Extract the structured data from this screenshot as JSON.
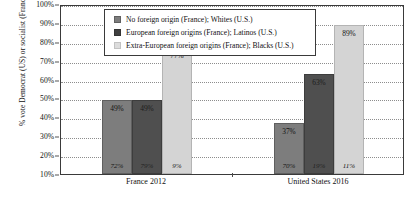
{
  "chart_data": {
    "type": "bar",
    "title": "",
    "xlabel": "",
    "ylabel": "% vote Democrat (US) or socialist (France)",
    "ylim": [
      10,
      100
    ],
    "ytick_labels": [
      "100%",
      "90%",
      "80%",
      "70%",
      "60%",
      "50%",
      "40%",
      "30%",
      "20%",
      "10%"
    ],
    "ytick_values": [
      100,
      90,
      80,
      70,
      60,
      50,
      40,
      30,
      20,
      10
    ],
    "grid": true,
    "legend_position": "top-center",
    "categories": [
      "France 2012",
      "United States 2016"
    ],
    "series": [
      {
        "name": "No foreign origin (France); Whites (U.S.)",
        "color": "#7d7d7d",
        "values": [
          49,
          37
        ],
        "value_labels": [
          "49%",
          "37%"
        ],
        "base_labels": [
          "72%",
          "70%"
        ]
      },
      {
        "name": "European foreign origins (France); Latinos (U.S.)",
        "color": "#4f4f4f",
        "values": [
          49,
          63
        ],
        "value_labels": [
          "49%",
          "63%"
        ],
        "base_labels": [
          "79%",
          "19%"
        ]
      },
      {
        "name": "Extra-European foreign origins (France); Blacks (U.S.)",
        "color": "#d4d4d4",
        "values": [
          77,
          89
        ],
        "value_labels": [
          "77%",
          "89%"
        ],
        "base_labels": [
          "9%",
          "11%"
        ]
      }
    ]
  },
  "legend": {
    "items": [
      {
        "label": "No foreign origin (France); Whites (U.S.)"
      },
      {
        "label": "European foreign origins (France); Latinos (U.S.)"
      },
      {
        "label": "Extra-European foreign origins (France); Blacks (U.S.)"
      }
    ]
  },
  "y_axis": {
    "title": "% vote Democrat (US) or socialist (France)",
    "ticks": [
      "100%",
      "90%",
      "80%",
      "70%",
      "60%",
      "50%",
      "40%",
      "30%",
      "20%",
      "10%"
    ]
  },
  "x_axis": {
    "categories": [
      "France 2012",
      "United States 2016"
    ]
  }
}
